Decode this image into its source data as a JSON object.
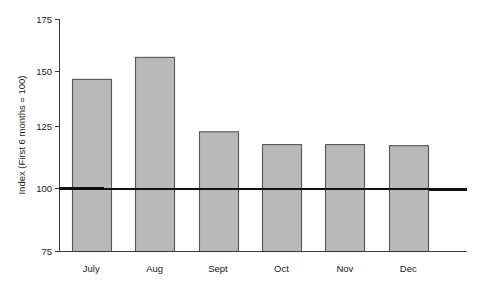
{
  "chart_data": {
    "type": "bar",
    "title": "",
    "subtitle": "",
    "xlabel": "",
    "ylabel": "Index (First 6 months = 100)",
    "categories": [
      "July",
      "Aug",
      "Sept",
      "Oct",
      "Nov",
      "Dec"
    ],
    "values": [
      149,
      158.5,
      126.5,
      121,
      121,
      120.5
    ],
    "ylim": [
      75,
      175
    ],
    "yticks": [
      75,
      100,
      125,
      150,
      175
    ],
    "ytick_labels": [
      "75",
      "100",
      "125",
      "150",
      "175"
    ],
    "grid": false,
    "legend": null,
    "legend_position": "none",
    "reference_line": {
      "value": 100,
      "label": "",
      "color": "#111111"
    },
    "series": [
      {
        "name": "Index",
        "values": [
          149,
          158.5,
          126.5,
          121,
          121,
          120.5
        ]
      }
    ],
    "bar_color": "#b9b9b9",
    "bar_edge_color": "#555555",
    "axis_color": "#3a3a3a"
  },
  "axis": {
    "y_title": "Index (First 6 months = 100)",
    "ticks": [
      {
        "label": "175",
        "value": 175
      },
      {
        "label": "150",
        "value": 150
      },
      {
        "label": "125",
        "value": 125
      },
      {
        "label": "100",
        "value": 100
      },
      {
        "label": "75",
        "value": 75
      }
    ]
  },
  "bars": [
    {
      "label": "July",
      "value": 149
    },
    {
      "label": "Aug",
      "value": 158.5
    },
    {
      "label": "Sept",
      "value": 126.5
    },
    {
      "label": "Oct",
      "value": 121
    },
    {
      "label": "Nov",
      "value": 121
    },
    {
      "label": "Dec",
      "value": 120.5
    }
  ]
}
